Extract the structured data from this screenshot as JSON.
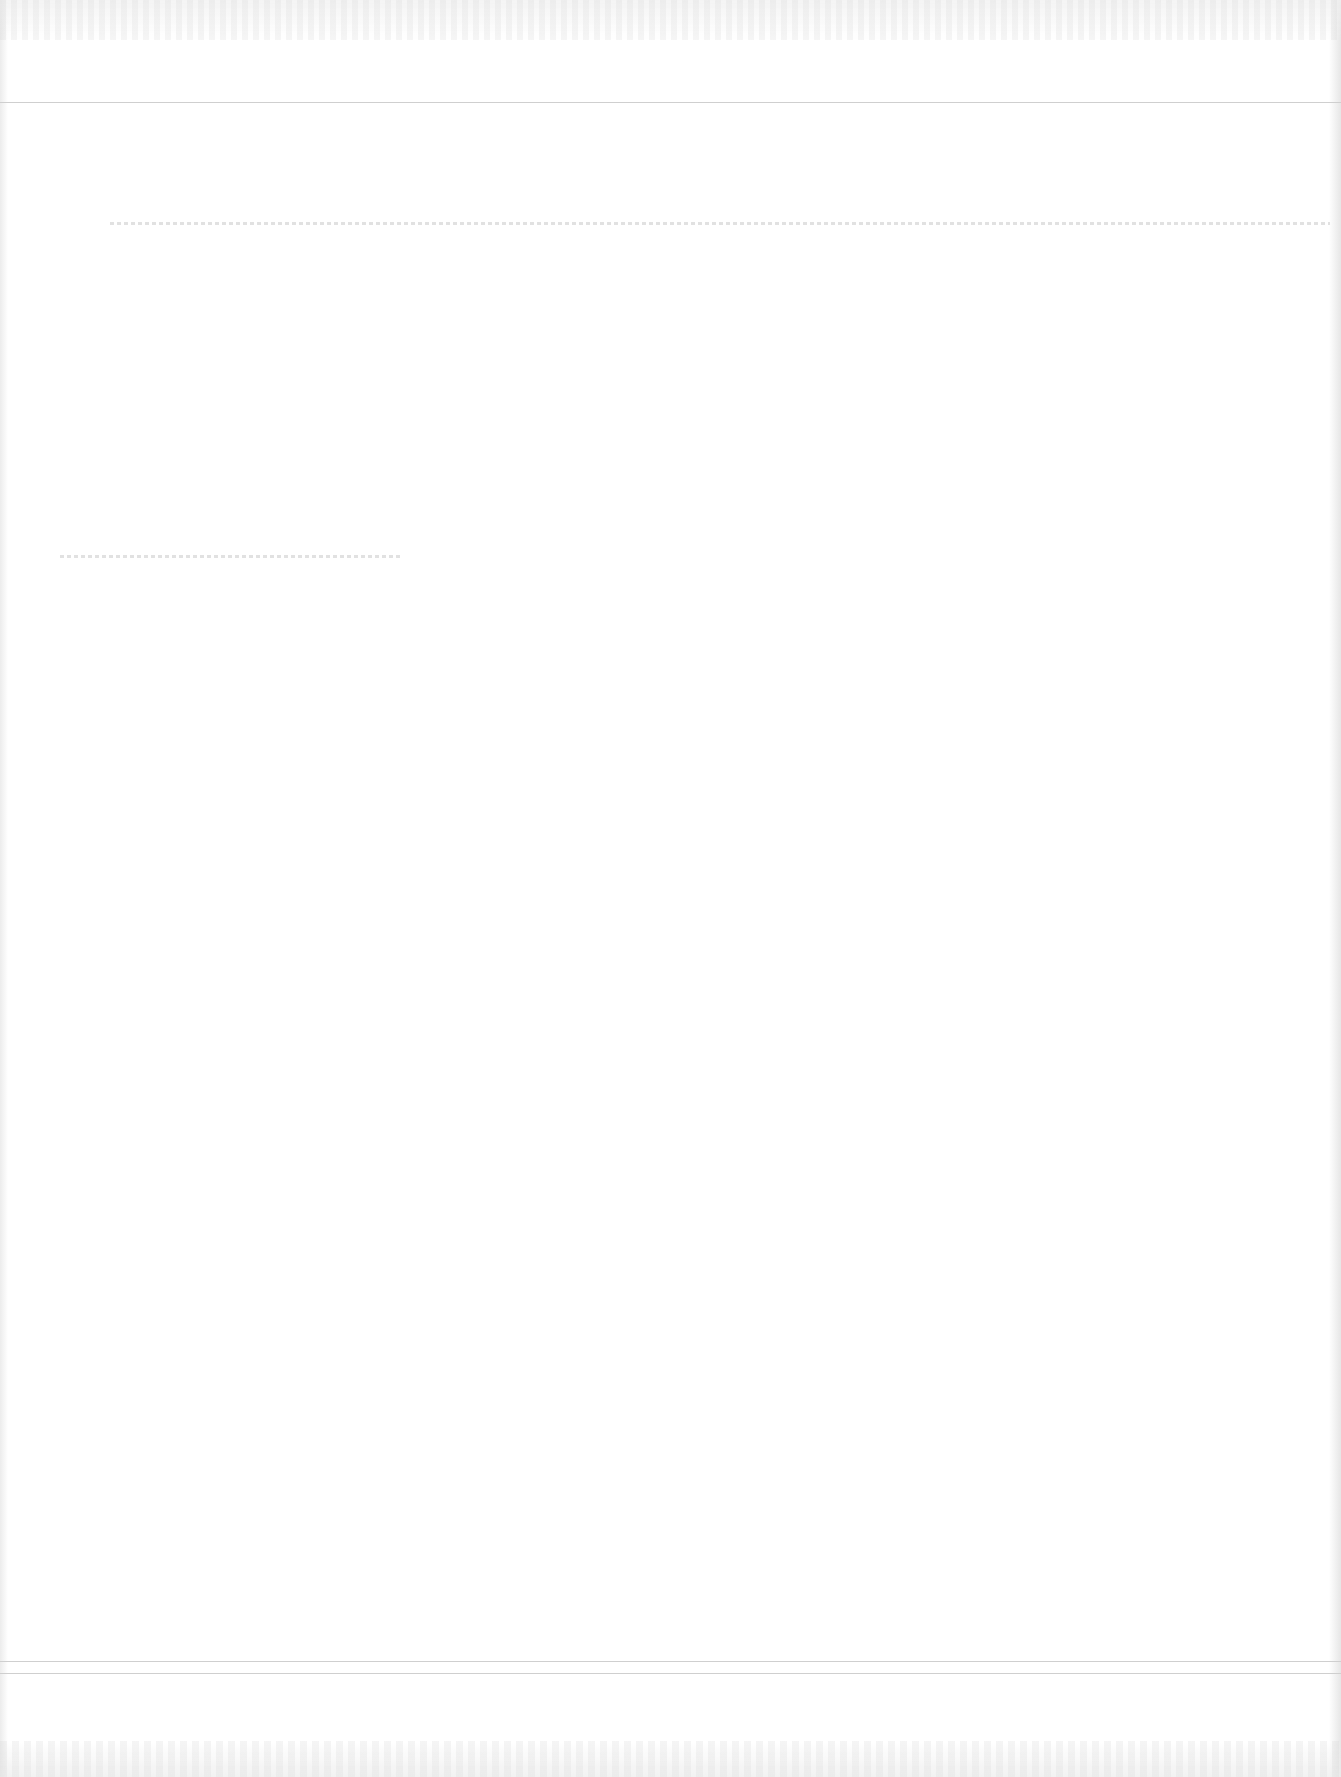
{
  "page": {
    "background": "#ffffff",
    "rule_color": "#cfcfcf"
  },
  "rules": [
    {
      "name": "top-rule",
      "top": 102
    },
    {
      "name": "bottom-rule-1",
      "top": 1661
    },
    {
      "name": "bottom-rule-2",
      "top": 1673
    }
  ],
  "faint_marks": [
    {
      "name": "faint-text-line-1",
      "top": 222,
      "left": 110,
      "width": 1220
    },
    {
      "name": "faint-text-line-2",
      "top": 555,
      "left": 60,
      "width": 340
    }
  ]
}
